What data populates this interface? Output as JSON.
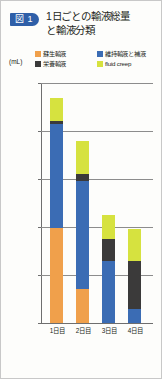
{
  "header": {
    "badge": "図 1",
    "title_line1": "1日ごとの輸液総量",
    "title_line2": "と輸液分類",
    "badge_color": "#2f5fa8"
  },
  "legend": {
    "items": [
      {
        "label": "蘇生輸液",
        "color": "#f0a04b",
        "key": "resuscitation"
      },
      {
        "label": "維持輸液と補液",
        "color": "#3b6cb4",
        "key": "maintenance"
      },
      {
        "label": "栄養輸液",
        "color": "#3b3a3a",
        "key": "nutrition"
      },
      {
        "label": "fluid creep",
        "color": "#d6e23f",
        "key": "fluid_creep"
      }
    ]
  },
  "axis": {
    "unit": "(mL)",
    "y_ticks": [
      "5,000",
      "4,000",
      "3,000",
      "2,000",
      "1,000",
      "0"
    ],
    "x_ticks": [
      "1日目",
      "2日目",
      "3日目",
      "4日目"
    ]
  },
  "chart_data": {
    "type": "bar",
    "stacked": true,
    "xlabel": "",
    "ylabel": "(mL)",
    "ylim": [
      0,
      5000
    ],
    "ytick_step": 1000,
    "grid": true,
    "legend_position": "top",
    "categories": [
      "1日目",
      "2日目",
      "3日目",
      "4日目"
    ],
    "series": [
      {
        "name": "蘇生輸液",
        "color": "#f0a04b",
        "values": [
          1980,
          700,
          0,
          0
        ]
      },
      {
        "name": "維持輸液と補液",
        "color": "#3b6cb4",
        "values": [
          2170,
          2250,
          1300,
          300
        ]
      },
      {
        "name": "栄養輸液",
        "color": "#3b3a3a",
        "values": [
          60,
          150,
          450,
          1000
        ]
      },
      {
        "name": "fluid creep",
        "color": "#d6e23f",
        "values": [
          470,
          690,
          500,
          650
        ]
      }
    ],
    "totals": [
      4680,
      3790,
      2250,
      1950
    ]
  }
}
